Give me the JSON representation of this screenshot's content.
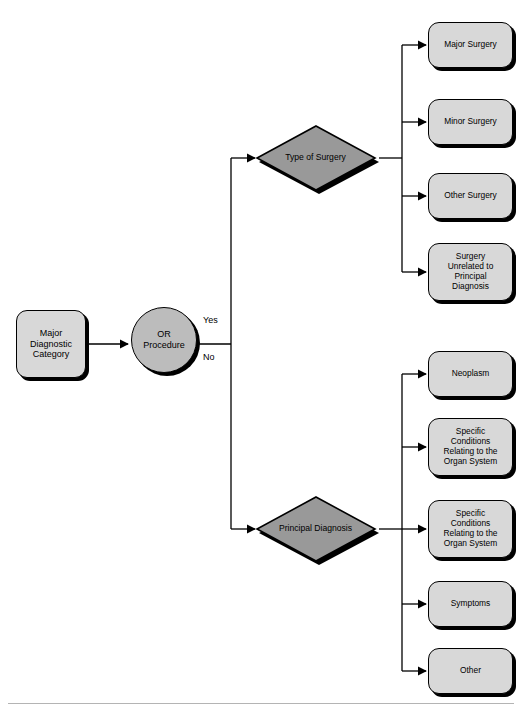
{
  "diagram": {
    "colors": {
      "box_fill": "#d8d8d8",
      "circle_fill": "#bcbcbc",
      "diamond_fill": "#999999",
      "stroke": "#000000",
      "shadow": "#000000",
      "background": "#ffffff",
      "rule": "#b4b4b4"
    },
    "start": {
      "label": "Major\nDiagnostic\nCategory"
    },
    "decision_circle": {
      "label": "OR\nProcedure"
    },
    "branch_labels": {
      "yes": "Yes",
      "no": "No"
    },
    "decisions": [
      {
        "label": "Type of Surgery"
      },
      {
        "label": "Principal Diagnosis"
      }
    ],
    "surgery_outcomes": [
      {
        "label": "Major Surgery"
      },
      {
        "label": "Minor Surgery"
      },
      {
        "label": "Other Surgery"
      },
      {
        "label": "Surgery\nUnrelated to\nPrincipal\nDiagnosis"
      }
    ],
    "diagnosis_outcomes": [
      {
        "label": "Neoplasm"
      },
      {
        "label": "Specific\nConditions\nRelating to the\nOrgan System"
      },
      {
        "label": "Specific\nConditions\nRelating to the\nOrgan System"
      },
      {
        "label": "Symptoms"
      },
      {
        "label": "Other"
      }
    ],
    "footer_caption": ""
  }
}
